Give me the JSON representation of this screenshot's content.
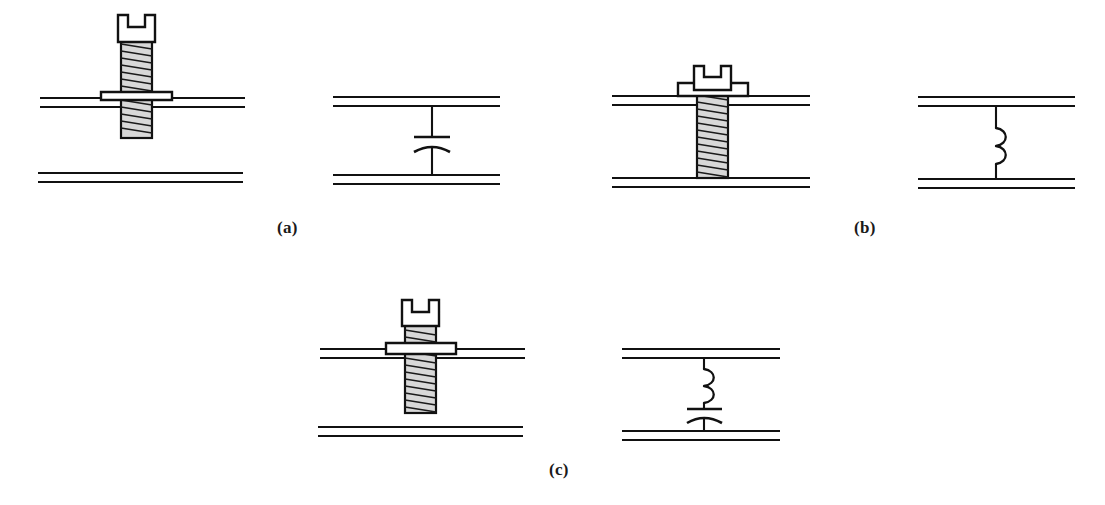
{
  "figure": {
    "background_color": "#ffffff",
    "ink_color": "#111111",
    "panels": [
      {
        "id": "a",
        "label": "(a)",
        "label_x": 285,
        "label_y": 228,
        "mechanical": {
          "name": "short-screw-through-top-plate",
          "screw_type": "slotted-pan-head-with-flange",
          "screw_tip_reaches_bottom_plate": false,
          "screw_length_class": "short",
          "upper_plate_y": 100,
          "lower_plate_y": 175,
          "plate_x_start": 40,
          "plate_x_end": 245,
          "screw_center_x": 136
        },
        "circuit": {
          "name": "series-capacitor",
          "elements": [
            "capacitor"
          ],
          "symbol": "capacitor",
          "upper_plate_y": 100,
          "lower_plate_y": 178,
          "plate_x_start": 333,
          "plate_x_end": 500,
          "element_center_x": 432
        }
      },
      {
        "id": "b",
        "label": "(b)",
        "label_x": 862,
        "label_y": 228,
        "mechanical": {
          "name": "long-screw-contacting-bottom-plate",
          "screw_type": "slotted-pan-head-with-flange",
          "screw_tip_reaches_bottom_plate": true,
          "screw_length_class": "long",
          "upper_plate_y": 100,
          "lower_plate_y": 180,
          "plate_x_start": 612,
          "plate_x_end": 810,
          "screw_center_x": 712
        },
        "circuit": {
          "name": "series-inductor",
          "elements": [
            "inductor"
          ],
          "symbol": "inductor",
          "upper_plate_y": 100,
          "lower_plate_y": 182,
          "plate_x_start": 918,
          "plate_x_end": 1075,
          "element_center_x": 996
        }
      },
      {
        "id": "c",
        "label": "(c)",
        "label_x": 557,
        "label_y": 470,
        "mechanical": {
          "name": "medium-screw-near-bottom-plate",
          "screw_type": "slotted-pan-head-with-flange",
          "screw_tip_reaches_bottom_plate": false,
          "screw_length_class": "medium",
          "upper_plate_y": 352,
          "lower_plate_y": 430,
          "plate_x_start": 320,
          "plate_x_end": 525,
          "screw_center_x": 420
        },
        "circuit": {
          "name": "series-inductor-capacitor",
          "elements": [
            "inductor",
            "capacitor"
          ],
          "symbol": "inductor-capacitor-series",
          "upper_plate_y": 352,
          "lower_plate_y": 434,
          "plate_x_start": 622,
          "plate_x_end": 780,
          "element_center_x": 704
        }
      }
    ]
  }
}
